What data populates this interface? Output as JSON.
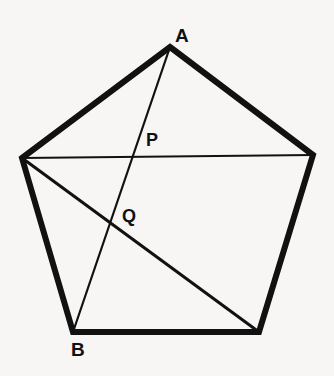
{
  "figure": {
    "type": "geometry-diagram",
    "canvas": {
      "width": 334,
      "height": 376
    },
    "background_color": "#f7f6f5",
    "ink_color": "#111111"
  },
  "geometry": {
    "shape": "regular-pentagon",
    "vertices": [
      {
        "id": "A",
        "role": "apex",
        "x": 170,
        "y": 47
      },
      {
        "id": "R",
        "role": "upper-right",
        "x": 313,
        "y": 155
      },
      {
        "id": "C",
        "role": "lower-right",
        "x": 259,
        "y": 332
      },
      {
        "id": "B",
        "role": "lower-left",
        "x": 73,
        "y": 332
      },
      {
        "id": "L",
        "role": "upper-left",
        "x": 22,
        "y": 158
      }
    ],
    "outline_path": "170,47 313,155 259,332 73,332 22,158",
    "outline_stroke_width": 6,
    "segments": [
      {
        "name": "horizontal-diagonal",
        "from": "L",
        "to": "R",
        "x1": 22,
        "y1": 158,
        "x2": 313,
        "y2": 155,
        "stroke_width": 2.2
      },
      {
        "name": "diagonal-left-to-lower-right",
        "from": "L",
        "to": "C",
        "x1": 22,
        "y1": 158,
        "x2": 259,
        "y2": 332,
        "stroke_width": 3
      },
      {
        "name": "segment-a-to-b",
        "from": "A",
        "to": "B",
        "x1": 170,
        "y1": 47,
        "x2": 73,
        "y2": 332,
        "stroke_width": 2.2
      }
    ],
    "intersections": [
      {
        "id": "P",
        "on": [
          "segment-a-to-b",
          "horizontal-diagonal"
        ],
        "x": 135,
        "y": 157
      },
      {
        "id": "Q",
        "on": [
          "segment-a-to-b",
          "diagonal-left-to-lower-right"
        ],
        "x": 113,
        "y": 223
      }
    ]
  },
  "labels": {
    "a": {
      "text": "A",
      "x": 175,
      "y": 26,
      "font_size": 19
    },
    "b": {
      "text": "B",
      "x": 71,
      "y": 340,
      "font_size": 19
    },
    "p": {
      "text": "P",
      "x": 146,
      "y": 131,
      "font_size": 18
    },
    "q": {
      "text": "Q",
      "x": 122,
      "y": 207,
      "font_size": 18
    }
  }
}
